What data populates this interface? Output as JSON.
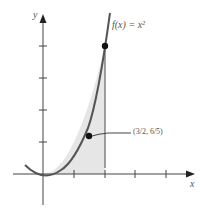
{
  "figure": {
    "function_label": "f(x) = x²",
    "x_axis_label": "x",
    "y_axis_label": "y",
    "point_on_curve": {
      "x": 2,
      "y": 4
    },
    "centroid": {
      "x": "3/2",
      "y": "6/5"
    },
    "centroid_label": "(3/2, 6/5)",
    "centroid_label_display": "( , )",
    "x_ticks": [
      1,
      2,
      3,
      4
    ],
    "y_ticks": [
      1,
      2,
      3,
      4
    ],
    "shaded_region": "area under y = x² from x = 0 to x = 2",
    "colors": {
      "curve": "#555555",
      "shade": "#e6e6e6",
      "axis": "#444444"
    }
  }
}
